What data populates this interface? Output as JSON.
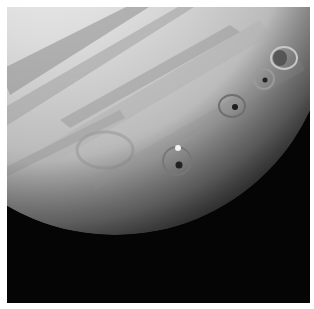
{
  "image": {
    "subject": "Jupiter with dark impact sites circled",
    "background_color": "#050505",
    "border_color": "#ffffff",
    "impact_markers": [
      {
        "label": "impact-site-1",
        "cx": 283,
        "cy": 58,
        "rx": 14,
        "ry": 12
      },
      {
        "label": "impact-site-2",
        "cx": 265,
        "cy": 80,
        "rx": 11,
        "ry": 11
      },
      {
        "label": "impact-site-3",
        "cx": 233,
        "cy": 105,
        "rx": 14,
        "ry": 12
      },
      {
        "label": "impact-site-4",
        "cx": 177,
        "cy": 160,
        "rx": 14,
        "ry": 14
      }
    ]
  }
}
